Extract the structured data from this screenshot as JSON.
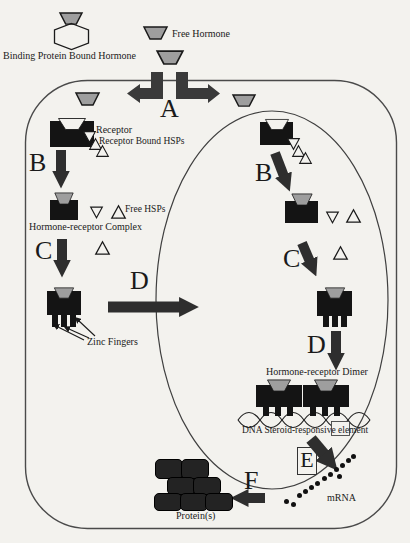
{
  "diagram": {
    "labels": {
      "binding_protein_bound_hormone": "Binding Protein Bound Hormone",
      "free_hormone": "Free Hormone",
      "receptor": "Receptor",
      "receptor_bound_hsps": "Receptor Bound HSPs",
      "free_hsps": "Free HSPs",
      "hormone_receptor_complex": "Hormone-receptor Complex",
      "zinc_fingers": "Zinc Fingers",
      "hormone_receptor_dimer": "Hormone-receptor Dimer",
      "dna_element": "DNA Steroid-responsive element",
      "mrna": "mRNA",
      "proteins": "Protein(s)"
    },
    "steps": {
      "a": "A",
      "b": "B",
      "c": "C",
      "d": "D",
      "e": "E",
      "f": "F"
    },
    "colors": {
      "paper": "#f3f2ee",
      "ink": "#1a1a1a",
      "shape": "#141414",
      "hormone": "#9e9e9e",
      "arrow": "#2e2e2e",
      "membrane": "#4a4a4a"
    }
  }
}
